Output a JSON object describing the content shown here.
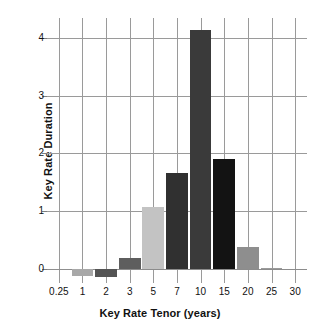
{
  "chart_data": {
    "type": "bar",
    "title": "",
    "xlabel": "Key Rate Tenor (years)",
    "ylabel": "Key Rate Duration",
    "categories": [
      "0.25",
      "1",
      "2",
      "3",
      "5",
      "7",
      "10",
      "15",
      "20",
      "25",
      "30"
    ],
    "values": [
      -0.02,
      -0.13,
      -0.15,
      0.19,
      1.07,
      1.66,
      4.15,
      1.91,
      0.37,
      0.01,
      0.0
    ],
    "bar_colors": [
      "#8f8f8f",
      "#a8a8a8",
      "#545454",
      "#5e5e5e",
      "#c3c3c3",
      "#303030",
      "#3a3a3a",
      "#131313",
      "#8e8e8e",
      "#9a9a9a",
      "#9a9a9a"
    ],
    "ylim": [
      -0.25,
      4.35
    ],
    "yticks": [
      0,
      1,
      2,
      3,
      4
    ],
    "ytick_labels": [
      "0",
      "1",
      "2",
      "3",
      "4"
    ],
    "grid": "both",
    "legend": "none",
    "axis_color": "#9a9a9a",
    "text_color": "#111111"
  }
}
